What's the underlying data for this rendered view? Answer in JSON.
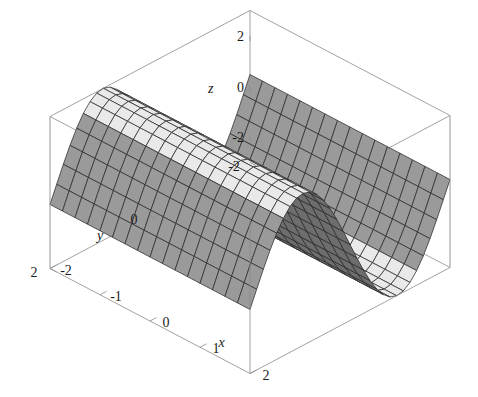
{
  "figure": {
    "kind": "surface-plot-3d",
    "background_color": "#ffffff",
    "width": 478,
    "height": 397
  },
  "axes": {
    "x": {
      "label": "x",
      "ticks": [
        "-2",
        "-1",
        "0",
        "1",
        "2"
      ],
      "tick_values": [
        -2,
        -1,
        0,
        1,
        2
      ],
      "range": [
        -2,
        2
      ]
    },
    "y": {
      "label": "y",
      "ticks": [
        "-2",
        "0",
        "2"
      ],
      "tick_values": [
        -2,
        0,
        2
      ],
      "range": [
        -2,
        2
      ]
    },
    "z": {
      "label": "z",
      "ticks": [
        "-2",
        "0",
        "2"
      ],
      "tick_values": [
        -2,
        0,
        2
      ],
      "range": [
        -3,
        3
      ]
    }
  },
  "style": {
    "surface_fill": "#e9e9e9",
    "surface_fill_shaded": "#9a9a9a",
    "surface_fill_dark": "#6d6d6d",
    "mesh_line_color": "#2b2b2b",
    "frame_line_color": "#8a8a8a",
    "text_color": "#1a1a1a"
  },
  "chart_data": {
    "type": "surface",
    "title": "",
    "xlabel": "x",
    "ylabel": "y",
    "zlabel": "z",
    "xlim": [
      -2,
      2
    ],
    "ylim": [
      -2,
      2
    ],
    "zlim": [
      -3,
      3
    ],
    "grid": false,
    "legend": false,
    "function": "z = 3*sin(y*1.65)",
    "mesh_nx": 16,
    "mesh_ny": 30,
    "view": {
      "azimuth_deg": -35,
      "elevation_deg": 22
    },
    "x": [
      -2,
      -1.733,
      -1.467,
      -1.2,
      -0.933,
      -0.667,
      -0.4,
      -0.133,
      0.133,
      0.4,
      0.667,
      0.933,
      1.2,
      1.467,
      1.733,
      2
    ],
    "y": [
      -2,
      -1.862,
      -1.724,
      -1.586,
      -1.448,
      -1.31,
      -1.172,
      -1.034,
      -0.897,
      -0.759,
      -0.621,
      -0.483,
      -0.345,
      -0.207,
      -0.069,
      0.069,
      0.207,
      0.345,
      0.483,
      0.621,
      0.759,
      0.897,
      1.034,
      1.172,
      1.31,
      1.448,
      1.586,
      1.724,
      1.862,
      2
    ],
    "z_profile": [
      -0.58,
      -1.11,
      -1.6,
      -2.03,
      -2.39,
      -2.67,
      -2.86,
      -2.97,
      -2.99,
      -2.92,
      -2.76,
      -2.52,
      -2.2,
      -1.81,
      -1.37,
      -0.9,
      -0.4,
      0.12,
      0.64,
      1.14,
      1.61,
      2.03,
      2.4,
      2.69,
      2.89,
      2.99,
      2.99,
      2.9,
      2.71,
      2.43
    ],
    "note": "z depends only on y; ridge-and-valley wave running along x"
  }
}
